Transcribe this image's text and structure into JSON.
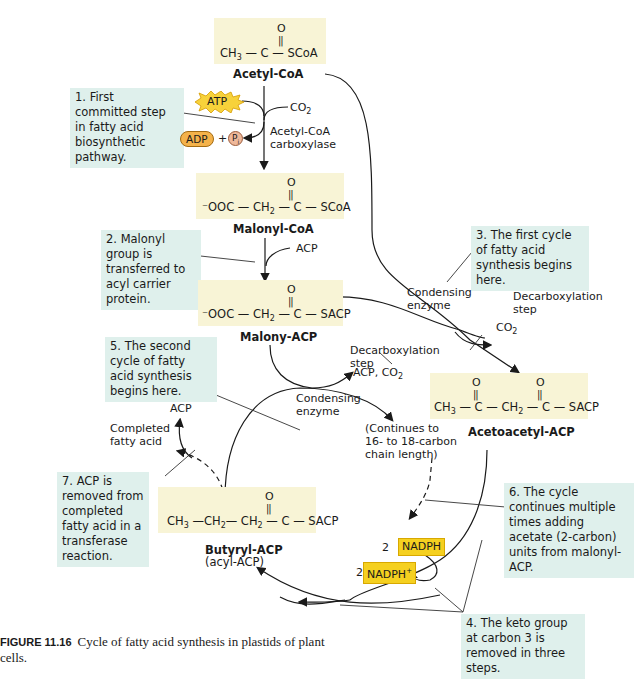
{
  "molecules": {
    "acetyl_coa": {
      "name": "Acetyl-CoA",
      "o": "O",
      "left": "CH",
      "left_sub": "3",
      "mid": " — C — SCoA"
    },
    "malonyl_coa": {
      "name": "Malonyl-CoA",
      "o": "O",
      "left": "⁻OOC — CH",
      "left_sub": "2",
      "mid": " — C — SCoA"
    },
    "malonyl_acp": {
      "name": "Malony-ACP",
      "o": "O",
      "left": "⁻OOC — CH",
      "left_sub": "2",
      "mid": " — C — SACP"
    },
    "acetoacetyl_acp": {
      "name": "Acetoacetyl-ACP",
      "o1": "O",
      "o2": "O",
      "p1": "CH",
      "p1_sub": "3",
      "p2": " — C — CH",
      "p2_sub": "2",
      "p3": " — C — SACP"
    },
    "butyryl_acp": {
      "name": "Butyryl-ACP",
      "subname": "(acyl-ACP)",
      "o": "O",
      "p1": "CH",
      "p1_sub": "3",
      "p2": " —CH",
      "p2_sub": "2",
      "p3": "— CH",
      "p3_sub": "2",
      "p4": " — C — SACP"
    }
  },
  "notes": {
    "n1": "1. First committed step in fatty acid biosynthetic pathway.",
    "n2": "2. Malonyl group is transferred to acyl carrier protein.",
    "n3": "3. The first cycle of fatty acid synthesis begins here.",
    "n4": "4. The keto group at carbon 3 is removed in three steps.",
    "n5": "5. The second cycle of fatty acid synthesis begins here.",
    "n6": "6. The cycle continues multiple times adding acetate (2-carbon) units from malonyl-ACP.",
    "n7": "7. ACP is removed from completed fatty acid in a transferase reaction."
  },
  "labels": {
    "atp": "ATP",
    "adp": "ADP",
    "plus": "+",
    "pi": "P",
    "pi_sub": "i",
    "co2_top": "CO",
    "co2_top_sub": "2",
    "carboxylase_1": "Acetyl-CoA",
    "carboxylase_2": "carboxylase",
    "acp_in": "ACP",
    "condensing_1_a": "Condensing",
    "condensing_1_b": "enzyme",
    "decarb_1_a": "Decarboxylation",
    "decarb_1_b": "step",
    "co2_right": "CO",
    "co2_right_sub": "2",
    "decarb_2_a": "Decarboxylation",
    "decarb_2_b": "step",
    "acp_co2": "ACP, CO",
    "acp_co2_sub": "2",
    "condensing_2_a": "Condensing",
    "condensing_2_b": "enzyme",
    "continues_1": "(Continues to",
    "continues_2": "16- to 18-carbon",
    "continues_3": "chain length)",
    "acp_out": "ACP",
    "completed_1": "Completed",
    "completed_2": "fatty acid",
    "nadph_coef": "2",
    "nadph": "NADPH",
    "nadp_coef": "2",
    "nadp": "NADPH",
    "nadp_sup": "+"
  },
  "caption": {
    "figure": "FIGURE 11.16",
    "text": "Cycle of fatty acid synthesis in plastids of plant cells."
  },
  "colors": {
    "molecule_bg": "#f8f4d6",
    "note_bg": "#dff0ec",
    "nadph_bg": "#f5d020",
    "atp_bg": "#f7d23a",
    "adp_bg": "#f4b24a"
  }
}
